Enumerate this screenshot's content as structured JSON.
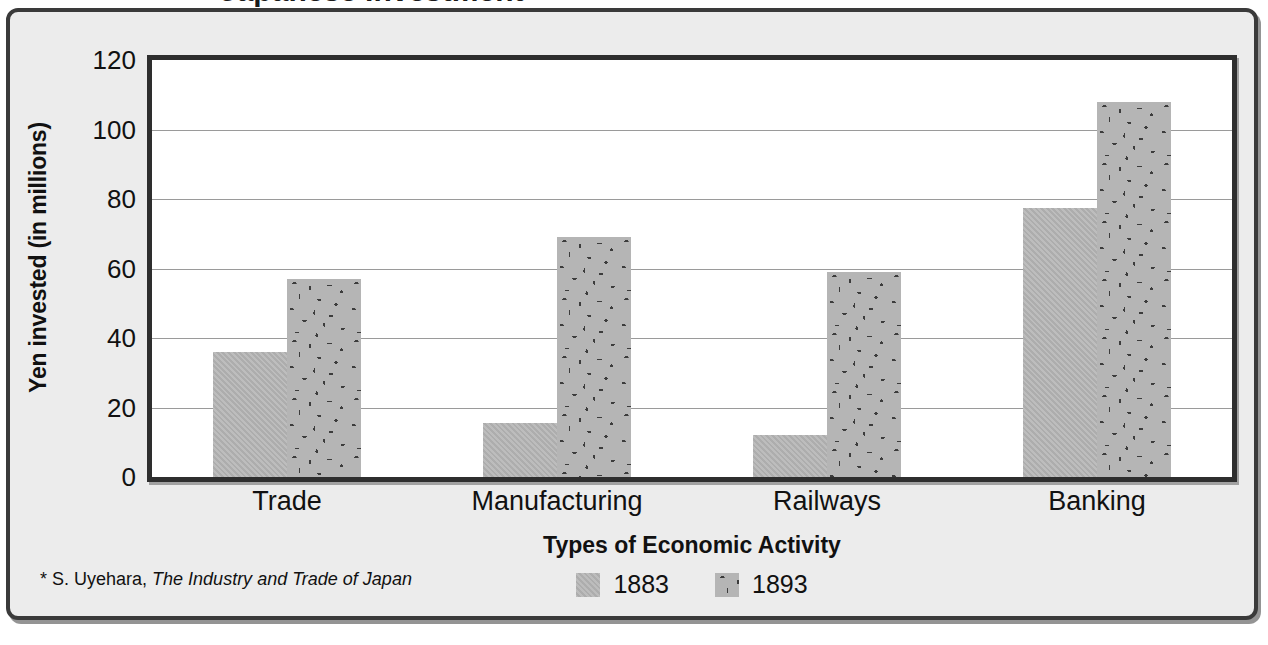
{
  "panel": {
    "citation_prefix": "* S. Uyehara,",
    "citation_title": "The Industry and Trade of Japan"
  },
  "chart_data": {
    "type": "bar",
    "title": "",
    "xlabel": "Types of Economic Activity",
    "ylabel": "Yen invested (in millions)",
    "categories": [
      "Trade",
      "Manufacturing",
      "Railways",
      "Banking"
    ],
    "series": [
      {
        "name": "1883",
        "values": [
          36,
          15.5,
          12,
          77.5
        ],
        "fill": "solid-gray",
        "color": "#b5b5b5"
      },
      {
        "name": "1893",
        "values": [
          57,
          69,
          59,
          108
        ],
        "fill": "speckled-gray",
        "color": "#b5b5b5"
      }
    ],
    "ylim": [
      0,
      120
    ],
    "yticks": [
      120,
      100,
      80,
      60,
      40,
      20,
      0
    ],
    "grid": true,
    "legend_position": "bottom-center"
  }
}
